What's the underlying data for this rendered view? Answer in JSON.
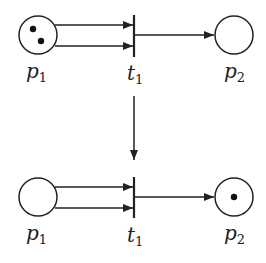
{
  "diagram": {
    "type": "petri-net-firing",
    "colors": {
      "stroke": "#222222",
      "token": "#111111",
      "background": "#ffffff"
    },
    "before": {
      "places": [
        {
          "id": "p1",
          "label_base": "p",
          "label_sub": "1",
          "tokens": 2
        },
        {
          "id": "p2",
          "label_base": "p",
          "label_sub": "2",
          "tokens": 0
        }
      ],
      "transition": {
        "id": "t1",
        "label_base": "t",
        "label_sub": "1"
      },
      "arcs": [
        {
          "from": "p1",
          "to": "t1",
          "weight": 1
        },
        {
          "from": "p1",
          "to": "t1",
          "weight": 1
        },
        {
          "from": "t1",
          "to": "p2",
          "weight": 1
        }
      ]
    },
    "after": {
      "places": [
        {
          "id": "p1",
          "label_base": "p",
          "label_sub": "1",
          "tokens": 0
        },
        {
          "id": "p2",
          "label_base": "p",
          "label_sub": "2",
          "tokens": 1
        }
      ],
      "transition": {
        "id": "t1",
        "label_base": "t",
        "label_sub": "1"
      },
      "arcs": [
        {
          "from": "p1",
          "to": "t1",
          "weight": 1
        },
        {
          "from": "p1",
          "to": "t1",
          "weight": 1
        },
        {
          "from": "t1",
          "to": "p2",
          "weight": 1
        }
      ]
    },
    "transition_arrow": "fires"
  }
}
